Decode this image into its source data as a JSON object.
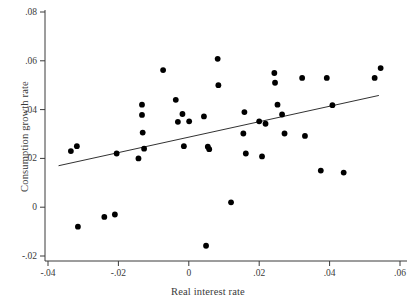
{
  "chart_data": {
    "type": "scatter",
    "title": "",
    "xlabel": "Real interest rate",
    "ylabel": "Consumption growth rate",
    "xlim": [
      -0.045,
      0.062
    ],
    "ylim": [
      -0.023,
      0.082
    ],
    "xticks": [
      -0.04,
      -0.02,
      0,
      0.02,
      0.04,
      0.06
    ],
    "xticklabels": [
      "-.04",
      "-.02",
      "0",
      ".02",
      ".04",
      ".06"
    ],
    "yticks": [
      -0.02,
      0,
      0.02,
      0.04,
      0.06,
      0.08
    ],
    "yticklabels": [
      "-.02",
      "0",
      ".02",
      ".04",
      ".06",
      ".08"
    ],
    "grid": false,
    "legend": null,
    "marker_color": "#000000",
    "line_color": "#1a1a1a",
    "points": [
      {
        "x": -0.0335,
        "y": 0.023
      },
      {
        "x": -0.0318,
        "y": 0.025
      },
      {
        "x": -0.0315,
        "y": -0.008
      },
      {
        "x": -0.024,
        "y": -0.004
      },
      {
        "x": -0.021,
        "y": -0.003
      },
      {
        "x": -0.0205,
        "y": 0.022
      },
      {
        "x": -0.0143,
        "y": 0.02
      },
      {
        "x": -0.0133,
        "y": 0.042
      },
      {
        "x": -0.0133,
        "y": 0.0378
      },
      {
        "x": -0.0131,
        "y": 0.0306
      },
      {
        "x": -0.0127,
        "y": 0.024
      },
      {
        "x": -0.0073,
        "y": 0.0562
      },
      {
        "x": -0.0037,
        "y": 0.044
      },
      {
        "x": -0.0031,
        "y": 0.035
      },
      {
        "x": -0.0018,
        "y": 0.0382
      },
      {
        "x": -0.0014,
        "y": 0.025
      },
      {
        "x": 0.0001,
        "y": 0.0352
      },
      {
        "x": 0.0043,
        "y": 0.0372
      },
      {
        "x": 0.0049,
        "y": -0.0158
      },
      {
        "x": 0.0054,
        "y": 0.0248
      },
      {
        "x": 0.0058,
        "y": 0.0238
      },
      {
        "x": 0.0082,
        "y": 0.0608
      },
      {
        "x": 0.0084,
        "y": 0.05
      },
      {
        "x": 0.012,
        "y": 0.002
      },
      {
        "x": 0.0155,
        "y": 0.0302
      },
      {
        "x": 0.0158,
        "y": 0.039
      },
      {
        "x": 0.0162,
        "y": 0.022
      },
      {
        "x": 0.02,
        "y": 0.0352
      },
      {
        "x": 0.0208,
        "y": 0.0208
      },
      {
        "x": 0.0218,
        "y": 0.0342
      },
      {
        "x": 0.0243,
        "y": 0.055
      },
      {
        "x": 0.0245,
        "y": 0.051
      },
      {
        "x": 0.0252,
        "y": 0.042
      },
      {
        "x": 0.0265,
        "y": 0.038
      },
      {
        "x": 0.0272,
        "y": 0.0302
      },
      {
        "x": 0.0322,
        "y": 0.053
      },
      {
        "x": 0.033,
        "y": 0.0292
      },
      {
        "x": 0.0375,
        "y": 0.015
      },
      {
        "x": 0.0392,
        "y": 0.053
      },
      {
        "x": 0.0408,
        "y": 0.0418
      },
      {
        "x": 0.044,
        "y": 0.0142
      },
      {
        "x": 0.0528,
        "y": 0.053
      },
      {
        "x": 0.0545,
        "y": 0.057
      }
    ],
    "fit_line": {
      "x1": -0.037,
      "y1": 0.017,
      "x2": 0.054,
      "y2": 0.0458
    }
  },
  "caption": ""
}
